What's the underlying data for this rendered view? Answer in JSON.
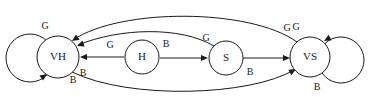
{
  "diagram": {
    "type": "state-transition-diagram",
    "title": "",
    "background_color": "#ffffff",
    "stroke_color": "#1a1a1a",
    "nodes": [
      {
        "id": "VH",
        "label": "VH",
        "cx": 58,
        "cy": 57,
        "r": 21
      },
      {
        "id": "H",
        "label": "H",
        "cx": 142,
        "cy": 57,
        "r": 17
      },
      {
        "id": "S",
        "label": "S",
        "cx": 226,
        "cy": 58,
        "r": 17
      },
      {
        "id": "VS",
        "label": "VS",
        "cx": 310,
        "cy": 57,
        "r": 20
      }
    ],
    "self_loops": [
      {
        "id": "vh-loop-g",
        "node": "VH",
        "label": "G",
        "label_x": 45,
        "label_y": 27,
        "side": "left",
        "cx": 30,
        "cy": 58,
        "r": 24
      },
      {
        "id": "vh-loop-b",
        "node": "VH",
        "label": "B",
        "label_x": 73,
        "label_y": 81,
        "side": "left-bottom",
        "cx": 30,
        "cy": 58,
        "r": 24
      },
      {
        "id": "vs-loop-g",
        "node": "VS",
        "label": "G",
        "label_x": 296,
        "label_y": 28,
        "side": "right",
        "cx": 341,
        "cy": 60,
        "r": 23
      },
      {
        "id": "vs-loop-b",
        "node": "VS",
        "label": "B",
        "label_x": 317,
        "label_y": 88,
        "side": "right-bottom",
        "cx": 341,
        "cy": 60,
        "r": 23
      }
    ],
    "edges": [
      {
        "id": "h-to-vh",
        "from": "H",
        "to": "VH",
        "label": "G",
        "label_x": 110,
        "label_y": 46,
        "shape": "straight",
        "path": "M 124 57 L 82 57",
        "arrow_x": 80,
        "arrow_y": 57,
        "arrow_angle": 180
      },
      {
        "id": "h-to-s",
        "from": "H",
        "to": "S",
        "label": "B",
        "label_x": 166,
        "label_y": 45,
        "shape": "straight",
        "path": "M 160 58 L 206 58",
        "arrow_x": 208,
        "arrow_y": 58,
        "arrow_angle": 0
      },
      {
        "id": "s-to-vs",
        "from": "S",
        "to": "VS",
        "label": "B",
        "label_x": 250,
        "label_y": 73,
        "shape": "straight",
        "path": "M 243 58 L 288 58",
        "arrow_x": 290,
        "arrow_y": 58,
        "arrow_angle": 0
      },
      {
        "id": "s-to-vh",
        "from": "S",
        "to": "VH",
        "label": "G",
        "label_x": 206,
        "label_y": 39,
        "shape": "curve-above",
        "path": "M 214 46 C 180 26 120 28 78 45",
        "arrow_x": 77,
        "arrow_y": 46,
        "arrow_angle": 159
      },
      {
        "id": "vs-to-vh",
        "from": "VS",
        "to": "VH",
        "label": "G",
        "label_x": 287,
        "label_y": 29,
        "shape": "curve-top",
        "path": "M 297 42 C 250 8 120 8 73 40",
        "arrow_x": 72,
        "arrow_y": 41,
        "arrow_angle": 146
      },
      {
        "id": "vh-to-vs",
        "from": "VH",
        "to": "VS",
        "label": "B",
        "label_x": 83,
        "label_y": 74,
        "shape": "curve-bottom",
        "path": "M 72 72 C 130 100 250 96 294 70",
        "arrow_x": 296,
        "arrow_y": 69,
        "arrow_angle": -30
      }
    ]
  }
}
